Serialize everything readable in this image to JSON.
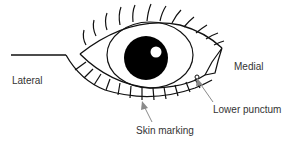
{
  "diagram": {
    "labels": {
      "lateral": "Lateral",
      "medial": "Medial",
      "lower_punctum": "Lower punctum",
      "skin_marking": "Skin marking"
    },
    "colors": {
      "line": "#111111",
      "pupil": "#000000",
      "arrow": "#8a8a8a",
      "text": "#333333"
    }
  }
}
